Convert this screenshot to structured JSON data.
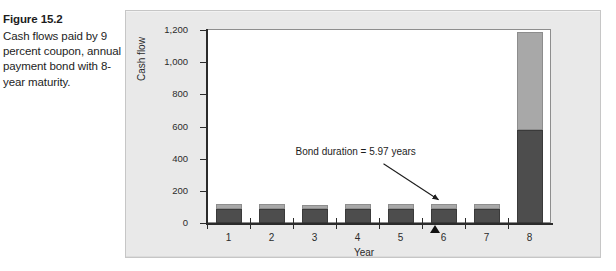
{
  "figure": {
    "number": "Figure 15.2",
    "caption": "Cash flows paid by 9 percent coupon, annual payment bond with 8-year maturity."
  },
  "colors": {
    "panel_background": "#e9e9e9",
    "plot_background": "#ffffff",
    "principal_bar": "#4d4d4d",
    "coupon_bar": "#a8a8a8",
    "axis": "#2b2b2b",
    "marker": "#111111"
  },
  "chart_data": {
    "type": "bar",
    "title": "",
    "xlabel": "Year",
    "ylabel": "Cash flow",
    "categories": [
      "1",
      "2",
      "3",
      "4",
      "5",
      "6",
      "7",
      "8"
    ],
    "ylim": [
      0,
      1200
    ],
    "yticks": [
      0,
      200,
      400,
      600,
      800,
      1000,
      1200
    ],
    "ytick_labels": [
      "0",
      "200",
      "400",
      "600",
      "800",
      "1,000",
      "1,200"
    ],
    "grid": false,
    "legend": "none",
    "stacked": true,
    "series": [
      {
        "name": "Principal / lower segment",
        "color": "#4d4d4d",
        "values": [
          88,
          90,
          88,
          90,
          88,
          90,
          88,
          580
        ]
      },
      {
        "name": "Coupon / upper segment",
        "color": "#a8a8a8",
        "values": [
          28,
          28,
          26,
          28,
          30,
          30,
          32,
          610
        ]
      }
    ],
    "totals": [
      116,
      118,
      114,
      118,
      118,
      120,
      120,
      1190
    ],
    "annotations": [
      {
        "text": "Bond duration = 5.97 years",
        "points_to_category": "6",
        "type": "arrow-label"
      },
      {
        "text": "",
        "points_to_category": "6",
        "type": "duration-triangle-marker"
      }
    ]
  }
}
